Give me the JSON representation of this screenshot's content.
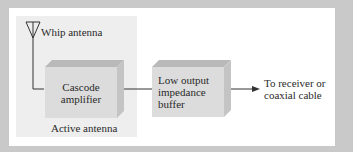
{
  "diagram": {
    "antenna_label": "Whip antenna",
    "region_label": "Active antenna",
    "blocks": [
      {
        "id": "cascode",
        "lines": [
          "Cascode",
          "amplifier"
        ]
      },
      {
        "id": "buffer",
        "lines": [
          "Low output",
          "impedance",
          "buffer"
        ]
      }
    ],
    "output_label": [
      "To receiver or",
      "coaxial cable"
    ],
    "colors": {
      "border": "#c9c9c9",
      "panel": "#ffffff",
      "region": "#eeeeee",
      "block_front": "#dcdcdc",
      "block_top": "#b9b9b9",
      "line": "#333333"
    }
  }
}
